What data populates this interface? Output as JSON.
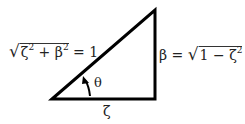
{
  "diagram": {
    "type": "right-triangle",
    "hypotenuse_label": {
      "prefix": "√",
      "zeta": "ζ",
      "exp1": "2",
      "plus": " + ",
      "beta": "β",
      "exp2": "2",
      "equals": " = 1"
    },
    "vertical_label": {
      "beta": "β",
      "equals": " = ",
      "prefix": "√",
      "one": "1 − ",
      "zeta": "ζ",
      "exp": "2"
    },
    "base_label": "ζ",
    "angle_label": "θ",
    "colors": {
      "lines": "#000000",
      "text": "#222222"
    }
  }
}
